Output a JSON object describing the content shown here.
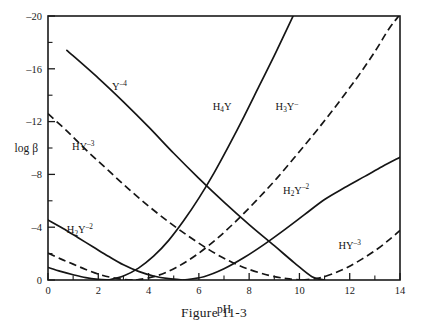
{
  "caption": "Figure 11-3",
  "axes": {
    "x_label": "pH",
    "y_label": "log β",
    "x_ticks": [
      "0",
      "2",
      "4",
      "6",
      "8",
      "10",
      "12",
      "14"
    ],
    "y_ticks": [
      "0",
      "–4",
      "–8",
      "–12",
      "–16",
      "–20"
    ]
  },
  "series_labels": {
    "y4": {
      "base": "Y",
      "sup": "–4"
    },
    "hy3_left": {
      "base": "HY",
      "sup": "–3"
    },
    "h2y2_left": {
      "base": "H",
      "sub": "2",
      "base2": "Y",
      "sup": "–2"
    },
    "h4y": {
      "base": "H",
      "sub": "4",
      "base2": "Y",
      "sup": ""
    },
    "h3y": {
      "base": "H",
      "sub": "3",
      "base2": "Y",
      "sup": "–"
    },
    "h2y2_right": {
      "base": "H",
      "sub": "2",
      "base2": "Y",
      "sup": "–2"
    },
    "hy3_right": {
      "base": "HY",
      "sup": "–3"
    }
  },
  "chart_data": {
    "type": "line",
    "title": "Figure 11-3",
    "xlabel": "pH",
    "ylabel": "log β",
    "xlim": [
      0,
      14
    ],
    "ylim": [
      0,
      -20
    ],
    "y_axis_inverted": true,
    "grid": false,
    "legend": "inline-labels",
    "x_major_ticks": [
      0,
      2,
      4,
      6,
      8,
      10,
      12,
      14
    ],
    "x_minor_ticks": [
      1,
      3,
      5,
      7,
      9,
      11,
      13
    ],
    "y_major_ticks": [
      0,
      -4,
      -8,
      -12,
      -16,
      -20
    ],
    "y_minor_ticks": [
      -2,
      -6,
      -10,
      -14,
      -18
    ],
    "series": [
      {
        "name": "Y-4",
        "style": "solid",
        "label_position": {
          "x": 2.45,
          "y": -14.2
        },
        "points": [
          {
            "x": 0.75,
            "y": -17.4
          },
          {
            "x": 2.0,
            "y": -15.3
          },
          {
            "x": 3.0,
            "y": -13.5
          },
          {
            "x": 4.0,
            "y": -11.6
          },
          {
            "x": 5.0,
            "y": -9.6
          },
          {
            "x": 6.0,
            "y": -7.7
          },
          {
            "x": 7.0,
            "y": -5.9
          },
          {
            "x": 8.0,
            "y": -4.2
          },
          {
            "x": 9.0,
            "y": -2.6
          },
          {
            "x": 9.8,
            "y": -1.3
          },
          {
            "x": 10.5,
            "y": -0.25
          },
          {
            "x": 11.0,
            "y": 0.0
          }
        ]
      },
      {
        "name": "HY-3 (left branch)",
        "style": "dashed",
        "label_position": {
          "x": 1.3,
          "y": -9.7
        },
        "points": [
          {
            "x": 0.0,
            "y": -12.6
          },
          {
            "x": 0.8,
            "y": -11.2
          },
          {
            "x": 1.6,
            "y": -9.7
          },
          {
            "x": 2.4,
            "y": -8.3
          },
          {
            "x": 3.2,
            "y": -6.9
          },
          {
            "x": 4.0,
            "y": -5.6
          },
          {
            "x": 4.8,
            "y": -4.4
          },
          {
            "x": 5.6,
            "y": -3.3
          },
          {
            "x": 6.4,
            "y": -2.3
          },
          {
            "x": 7.2,
            "y": -1.45
          },
          {
            "x": 8.0,
            "y": -0.8
          },
          {
            "x": 8.8,
            "y": -0.35
          },
          {
            "x": 9.5,
            "y": -0.1
          },
          {
            "x": 10.1,
            "y": 0.0
          }
        ]
      },
      {
        "name": "HY-3 (right branch)",
        "style": "dashed",
        "label_position": {
          "x": 11.7,
          "y": -2.3
        },
        "points": [
          {
            "x": 10.1,
            "y": 0.0
          },
          {
            "x": 10.7,
            "y": -0.12
          },
          {
            "x": 11.3,
            "y": -0.45
          },
          {
            "x": 11.9,
            "y": -0.95
          },
          {
            "x": 12.5,
            "y": -1.6
          },
          {
            "x": 13.1,
            "y": -2.35
          },
          {
            "x": 13.6,
            "y": -3.1
          },
          {
            "x": 14.0,
            "y": -3.75
          }
        ]
      },
      {
        "name": "H2Y-2 (left branch)",
        "style": "solid",
        "label_position": {
          "x": 1.25,
          "y": -3.5
        },
        "points": [
          {
            "x": 0.0,
            "y": -4.55
          },
          {
            "x": 0.6,
            "y": -3.9
          },
          {
            "x": 1.2,
            "y": -3.2
          },
          {
            "x": 1.8,
            "y": -2.5
          },
          {
            "x": 2.4,
            "y": -1.8
          },
          {
            "x": 3.0,
            "y": -1.15
          },
          {
            "x": 3.6,
            "y": -0.65
          },
          {
            "x": 4.2,
            "y": -0.3
          },
          {
            "x": 4.8,
            "y": -0.1
          },
          {
            "x": 5.4,
            "y": 0.0
          }
        ]
      },
      {
        "name": "H2Y-2 (right branch)",
        "style": "solid",
        "label_position": {
          "x": 9.1,
          "y": -6.4
        },
        "points": [
          {
            "x": 5.4,
            "y": 0.0
          },
          {
            "x": 6.2,
            "y": -0.25
          },
          {
            "x": 7.0,
            "y": -0.85
          },
          {
            "x": 7.8,
            "y": -1.7
          },
          {
            "x": 8.6,
            "y": -2.7
          },
          {
            "x": 9.4,
            "y": -3.8
          },
          {
            "x": 10.2,
            "y": -4.95
          },
          {
            "x": 11.0,
            "y": -6.1
          },
          {
            "x": 11.8,
            "y": -7.0
          },
          {
            "x": 12.6,
            "y": -7.85
          },
          {
            "x": 13.3,
            "y": -8.6
          },
          {
            "x": 14.0,
            "y": -9.3
          }
        ]
      },
      {
        "name": "H3Y- (left branch)",
        "style": "dashed",
        "label_position": {
          "x": 9.5,
          "y": -13.0
        },
        "points": [
          {
            "x": 0.0,
            "y": -2.05
          },
          {
            "x": 0.5,
            "y": -1.6
          },
          {
            "x": 1.0,
            "y": -1.2
          },
          {
            "x": 1.5,
            "y": -0.8
          },
          {
            "x": 2.0,
            "y": -0.45
          },
          {
            "x": 2.5,
            "y": -0.2
          },
          {
            "x": 3.0,
            "y": -0.05
          },
          {
            "x": 3.5,
            "y": 0.0
          }
        ]
      },
      {
        "name": "H3Y- (right branch)",
        "style": "dashed",
        "label_position": {
          "x": 9.5,
          "y": -13.0
        },
        "points": [
          {
            "x": 3.5,
            "y": 0.0
          },
          {
            "x": 4.3,
            "y": -0.3
          },
          {
            "x": 5.1,
            "y": -0.95
          },
          {
            "x": 5.9,
            "y": -1.9
          },
          {
            "x": 6.7,
            "y": -3.1
          },
          {
            "x": 7.5,
            "y": -4.5
          },
          {
            "x": 8.3,
            "y": -6.05
          },
          {
            "x": 9.1,
            "y": -7.7
          },
          {
            "x": 9.9,
            "y": -9.5
          },
          {
            "x": 10.7,
            "y": -11.35
          },
          {
            "x": 11.5,
            "y": -13.3
          },
          {
            "x": 12.3,
            "y": -15.35
          },
          {
            "x": 13.0,
            "y": -17.3
          },
          {
            "x": 13.55,
            "y": -19.0
          },
          {
            "x": 13.95,
            "y": -20.0
          }
        ]
      },
      {
        "name": "H4Y (left branch)",
        "style": "solid",
        "label_position": {
          "x": 7.0,
          "y": -12.8
        },
        "points": [
          {
            "x": 0.0,
            "y": -0.95
          },
          {
            "x": 0.5,
            "y": -0.65
          },
          {
            "x": 1.0,
            "y": -0.4
          },
          {
            "x": 1.5,
            "y": -0.18
          },
          {
            "x": 2.0,
            "y": -0.05
          },
          {
            "x": 2.4,
            "y": 0.0
          }
        ]
      },
      {
        "name": "H4Y (right branch)",
        "style": "solid",
        "label_position": {
          "x": 7.0,
          "y": -12.8
        },
        "points": [
          {
            "x": 2.4,
            "y": 0.0
          },
          {
            "x": 3.0,
            "y": -0.3
          },
          {
            "x": 3.6,
            "y": -0.9
          },
          {
            "x": 4.2,
            "y": -1.8
          },
          {
            "x": 4.8,
            "y": -3.0
          },
          {
            "x": 5.4,
            "y": -4.5
          },
          {
            "x": 6.0,
            "y": -6.2
          },
          {
            "x": 6.6,
            "y": -8.1
          },
          {
            "x": 7.2,
            "y": -10.2
          },
          {
            "x": 7.8,
            "y": -12.4
          },
          {
            "x": 8.4,
            "y": -14.7
          },
          {
            "x": 9.0,
            "y": -17.0
          },
          {
            "x": 9.45,
            "y": -18.8
          },
          {
            "x": 9.75,
            "y": -20.0
          }
        ]
      }
    ]
  }
}
